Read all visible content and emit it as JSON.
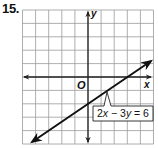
{
  "problem": {
    "number": "15."
  },
  "chart_data": {
    "type": "line",
    "title": "",
    "xlabel": "x",
    "ylabel": "y",
    "origin_label": "O",
    "xlim": [
      -5,
      5
    ],
    "ylim": [
      -5,
      5
    ],
    "grid": true,
    "grid_step": 1,
    "axis_arrows": true,
    "series": [
      {
        "name": "2x − 3y = 6",
        "equation": "2x - 3y = 6",
        "slope": 0.6667,
        "y_intercept": -2,
        "x_intercept": 3,
        "points": [
          [
            -4.4,
            -4.93
          ],
          [
            0,
            -2
          ],
          [
            3,
            0
          ],
          [
            4.9,
            1.27
          ]
        ],
        "arrows_both_ends": true,
        "color": "#111111"
      }
    ],
    "annotations": [
      {
        "text": "2x − 3y = 6",
        "target": [
          1.4,
          -1.07
        ],
        "position": "callout box below-right of line"
      }
    ]
  },
  "labels": {
    "x_axis": "x",
    "y_axis": "y",
    "origin": "O",
    "equation": {
      "part1": "2",
      "var1": "x",
      "part2": " − 3",
      "var2": "y",
      "part3": " = 6"
    }
  },
  "colors": {
    "grid": "#9a9a9a",
    "axis": "#222222",
    "line": "#111111",
    "background": "#ffffff"
  }
}
